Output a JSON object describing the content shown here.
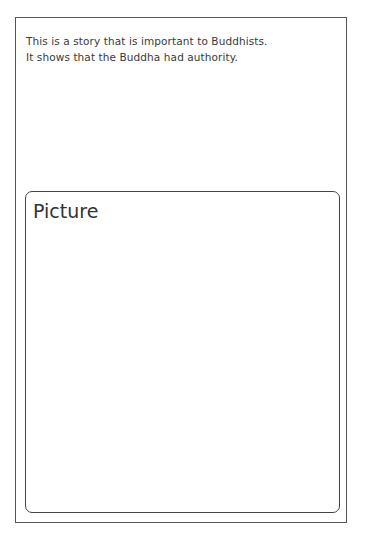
{
  "worksheet": {
    "intro_lines": [
      "This is a story that is important to Buddhists.",
      "It shows that the Buddha had authority."
    ],
    "picture_box": {
      "label": "Picture"
    }
  },
  "colors": {
    "frame_border": "#555555",
    "picture_border": "#444444",
    "text": "#333333",
    "background": "#ffffff"
  }
}
